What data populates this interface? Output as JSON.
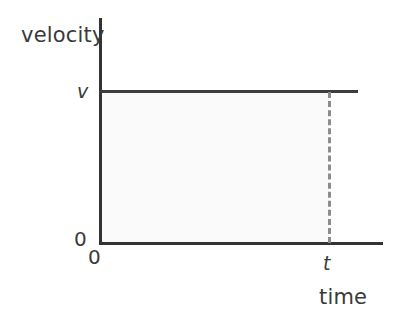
{
  "figure": {
    "background_color": "#ffffff",
    "width": 414,
    "height": 322
  },
  "labels": {
    "y_axis_title": "velocity",
    "x_axis_title": "time",
    "y_tick_top": "v",
    "y_tick_zero": "0",
    "x_tick_zero": "0",
    "x_tick_t": "t"
  },
  "colors": {
    "axis": "#333333",
    "curve": "#3d3d3d",
    "dashed_guide": "#8c8c8c",
    "shaded_area": "#fafafa",
    "text": "#3a3a3a"
  },
  "chart_data": {
    "type": "line",
    "title": "",
    "subtitle": "",
    "xlabel": "time",
    "ylabel": "velocity",
    "x": [
      0,
      1
    ],
    "xtick_labels": [
      "0",
      "t"
    ],
    "ytick_labels": [
      "0",
      "v"
    ],
    "xlim": [
      0,
      1.25
    ],
    "ylim": [
      0,
      1.2
    ],
    "grid": false,
    "legend": null,
    "series": [
      {
        "name": "velocity",
        "values": [
          1,
          1
        ],
        "style": "solid",
        "color": "#3d3d3d",
        "description": "constant velocity v from time 0 to time t"
      }
    ],
    "annotations": [
      {
        "name": "dashed-drop-line",
        "type": "vline",
        "x": 1,
        "y_from": 0,
        "y_to": 1,
        "style": "dashed",
        "color": "#8c8c8c"
      },
      {
        "name": "shaded-area",
        "type": "area",
        "x_from": 0,
        "x_to": 1,
        "y_from": 0,
        "y_to": 1,
        "fill": "#fafafa",
        "description": "area under the velocity line equals displacement v x t"
      }
    ]
  }
}
